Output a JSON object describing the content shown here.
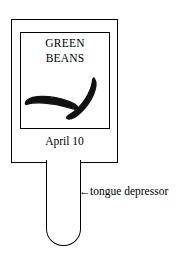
{
  "diagram": {
    "label_card": {
      "product_name_lines": [
        "GREEN",
        "BEANS"
      ],
      "date": "April 10",
      "illustration": {
        "name": "green-bean-pods",
        "pod_count": 2
      }
    },
    "annotation": {
      "arrow": "←",
      "text": "tongue depressor"
    },
    "colors": {
      "ink": "#000000",
      "paper": "#ffffff"
    }
  }
}
